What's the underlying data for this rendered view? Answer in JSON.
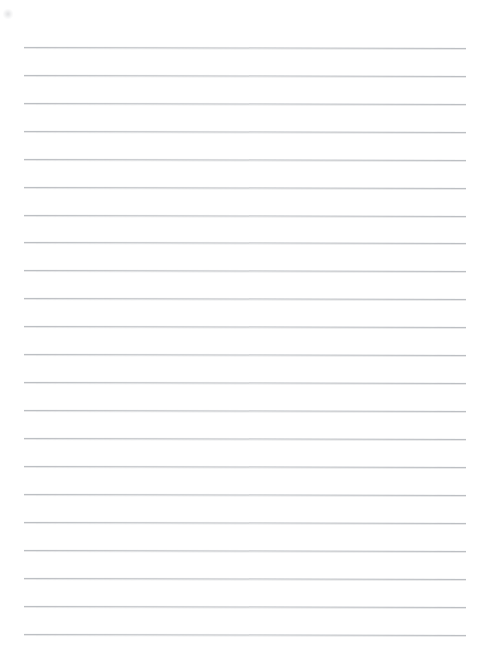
{
  "document": {
    "type": "lined-paper",
    "title": "Blank lined notebook paper",
    "has_text_content": false,
    "page_text": ""
  },
  "page": {
    "width": 483,
    "height": 666,
    "background_color": "#ffffff"
  },
  "ruling": {
    "line_color": "#b9bcc0",
    "line_count": 22,
    "line_thickness_px": 1,
    "line_spacing_px": 27.9,
    "first_line_y": 47,
    "last_line_y": 634,
    "line_start_x": 24,
    "line_end_x": 466,
    "skew_degrees": 0.13,
    "lines": [
      {
        "index": 1,
        "y": 47
      },
      {
        "index": 2,
        "y": 75
      },
      {
        "index": 3,
        "y": 103
      },
      {
        "index": 4,
        "y": 131
      },
      {
        "index": 5,
        "y": 159
      },
      {
        "index": 6,
        "y": 187
      },
      {
        "index": 7,
        "y": 215
      },
      {
        "index": 8,
        "y": 242
      },
      {
        "index": 9,
        "y": 270
      },
      {
        "index": 10,
        "y": 298
      },
      {
        "index": 11,
        "y": 326
      },
      {
        "index": 12,
        "y": 354
      },
      {
        "index": 13,
        "y": 382
      },
      {
        "index": 14,
        "y": 410
      },
      {
        "index": 15,
        "y": 438
      },
      {
        "index": 16,
        "y": 466
      },
      {
        "index": 17,
        "y": 494
      },
      {
        "index": 18,
        "y": 522
      },
      {
        "index": 19,
        "y": 550
      },
      {
        "index": 20,
        "y": 578
      },
      {
        "index": 21,
        "y": 606
      },
      {
        "index": 22,
        "y": 634
      }
    ]
  },
  "artifacts": {
    "smudge": {
      "name": "scan-smudge",
      "x": 3,
      "y": 9,
      "size": 10
    }
  }
}
